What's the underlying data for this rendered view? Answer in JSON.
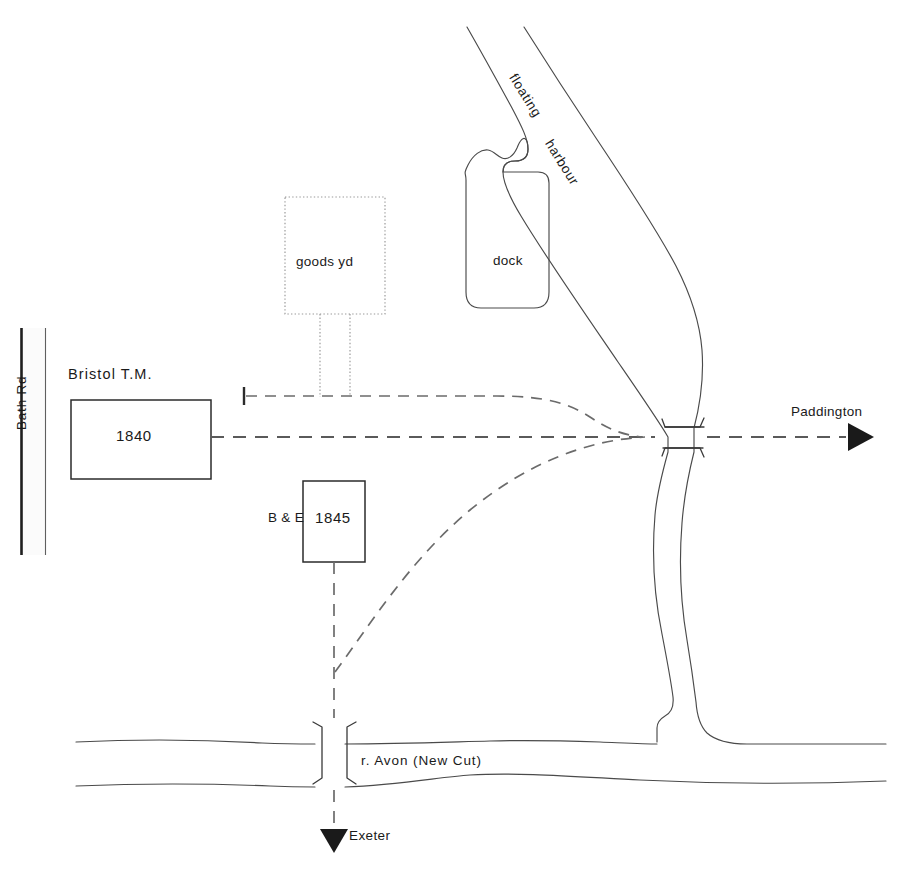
{
  "diagram": {
    "colors": {
      "ink": "#1a1a1a",
      "water_line": "#4a4a4a",
      "rail_dash": "#5a5a5a",
      "goods_dotted": "#9a9a9a",
      "road_fill": "#fbfbfb",
      "background": "#ffffff"
    },
    "stations": [
      {
        "id": "bristol-tm",
        "caption": "Bristol  T.M.",
        "year": "1840"
      },
      {
        "id": "bristol-be",
        "caption": "B & E",
        "year": "1845"
      }
    ],
    "areas": [
      {
        "id": "goods-yard",
        "label": "goods yd",
        "style": "dotted"
      },
      {
        "id": "dock",
        "label": "dock",
        "style": "outline"
      }
    ],
    "water": [
      {
        "id": "floating-harbour",
        "label_line_1": "floating",
        "label_line_2": "harbour"
      },
      {
        "id": "river-avon-new-cut",
        "label": "r. Avon  (New Cut)"
      }
    ],
    "roads": [
      {
        "id": "bath-road",
        "label": "Bath  Rd"
      }
    ],
    "routes": [
      {
        "id": "to-paddington",
        "label": "Paddington",
        "direction": "east",
        "arrow": "solid-triangle-right"
      },
      {
        "id": "to-exeter",
        "label": "Exeter",
        "direction": "south",
        "arrow": "solid-triangle-down"
      }
    ],
    "symbols": [
      {
        "id": "buffer-stop",
        "name": "buffer-stop"
      },
      {
        "id": "bridge-harbour",
        "name": "bridge-over-floating-harbour"
      },
      {
        "id": "bridge-newcut",
        "name": "bridge-over-new-cut"
      }
    ]
  }
}
